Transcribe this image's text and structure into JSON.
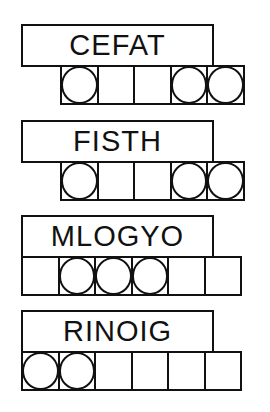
{
  "puzzles": [
    {
      "scrambled_word": "CEFAT",
      "cell_count": 5,
      "cells_offset_left": 60,
      "top": 24,
      "circled_cells": [
        true,
        false,
        false,
        true,
        true
      ]
    },
    {
      "scrambled_word": "FISTH",
      "cell_count": 5,
      "cells_offset_left": 60,
      "top": 120,
      "circled_cells": [
        true,
        false,
        false,
        true,
        true
      ]
    },
    {
      "scrambled_word": "MLOGYO",
      "cell_count": 6,
      "cells_offset_left": 21,
      "top": 215,
      "circled_cells": [
        false,
        true,
        true,
        true,
        false,
        false
      ]
    },
    {
      "scrambled_word": "RINOIG",
      "cell_count": 6,
      "cells_offset_left": 21,
      "top": 310,
      "circled_cells": [
        true,
        true,
        false,
        false,
        false,
        false
      ]
    }
  ],
  "colors": {
    "stroke": "#111111",
    "background": "#ffffff"
  }
}
